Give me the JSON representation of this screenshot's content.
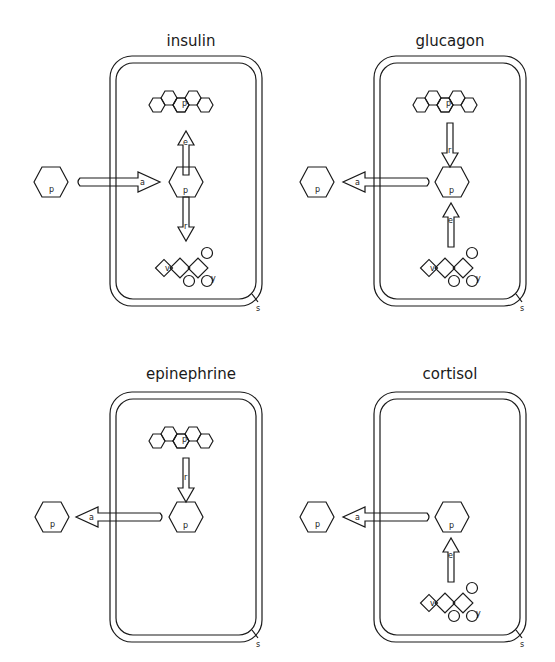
{
  "panels": [
    {
      "title": "insulin",
      "transport_label": "a",
      "upper_arrow_label": "e",
      "lower_arrow_label": "r",
      "membrane_label": "s",
      "molecule_label": "p",
      "glycogen_label": "p",
      "chain_labels": [
        "v",
        "y"
      ]
    },
    {
      "title": "glucagon",
      "transport_label": "a",
      "upper_arrow_label": "r",
      "lower_arrow_label": "e",
      "membrane_label": "s",
      "molecule_label": "p",
      "glycogen_label": "p",
      "chain_labels": [
        "v",
        "y"
      ]
    },
    {
      "title": "epinephrine",
      "transport_label": "a",
      "upper_arrow_label": "r",
      "membrane_label": "s",
      "molecule_label": "p",
      "glycogen_label": "p"
    },
    {
      "title": "cortisol",
      "transport_label": "a",
      "lower_arrow_label": "e",
      "membrane_label": "s",
      "molecule_label": "p",
      "chain_labels": [
        "v",
        "y"
      ]
    }
  ]
}
